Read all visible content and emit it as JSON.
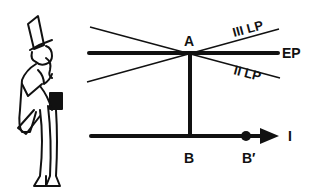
{
  "diagram": {
    "labels": {
      "point_a": "A",
      "point_b": "B",
      "point_b_prime": "B′",
      "ep": "EP",
      "iii_lp": "III LP",
      "ii_lp": "II LP",
      "axis_i": "I"
    },
    "figure": "gentleman-in-top-hat-illustration",
    "colors": {
      "ink": "#111111",
      "background": "#ffffff"
    }
  }
}
